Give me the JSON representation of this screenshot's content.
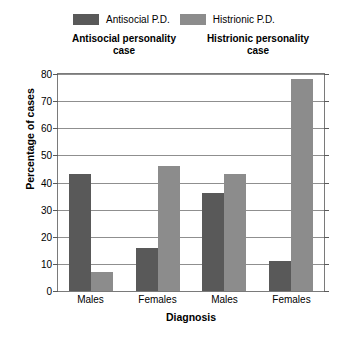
{
  "chart_data": {
    "type": "bar",
    "title": "",
    "xlabel": "Diagnosis",
    "ylabel": "Percentage of cases",
    "ylim": [
      0,
      80
    ],
    "ytick_step": 10,
    "yticks": [
      0,
      10,
      20,
      30,
      40,
      50,
      60,
      70,
      80
    ],
    "grid": true,
    "legend_position": "top-center",
    "categories": [
      "Males",
      "Females",
      "Males",
      "Females"
    ],
    "group_titles": [
      {
        "line1": "Antisocial personality",
        "line2": "case"
      },
      {
        "line1": "Histrionic personality",
        "line2": "case"
      }
    ],
    "series": [
      {
        "name": "Antisocial P.D.",
        "color": "#595959",
        "values": [
          43,
          16,
          36,
          11
        ]
      },
      {
        "name": "Histrionic P.D.",
        "color": "#8c8c8c",
        "values": [
          7,
          46,
          43,
          78
        ]
      }
    ]
  },
  "colors": {
    "antisocial": "#595959",
    "histrionic": "#8c8c8c",
    "grid": "#8f8f8f",
    "frame": "#7a7a7a",
    "background": "#ffffff"
  }
}
